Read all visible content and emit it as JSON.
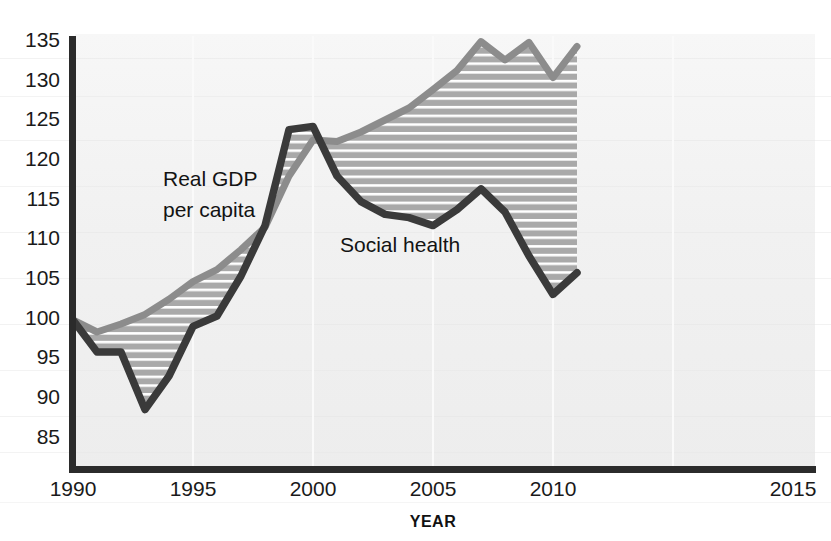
{
  "chart_data": {
    "type": "line",
    "title": "",
    "subtitle": "",
    "xlabel": "YEAR",
    "ylabel": "",
    "xlim": [
      1990,
      2015
    ],
    "ylim": [
      85,
      135
    ],
    "xticks": [
      1990,
      1995,
      2000,
      2005,
      2010,
      2015
    ],
    "yticks": [
      85,
      90,
      95,
      100,
      105,
      110,
      115,
      120,
      125,
      130,
      135
    ],
    "grid": "horizontal-hatch-between-series",
    "legend": "inline-annotations",
    "x": [
      1990,
      1991,
      1992,
      1993,
      1994,
      1995,
      1996,
      1997,
      1998,
      1999,
      2000,
      2001,
      2002,
      2003,
      2004,
      2005,
      2006,
      2007,
      2008,
      2009,
      2010,
      2011
    ],
    "series": [
      {
        "name": "Real GDP per capita",
        "color": "#8c8c8c",
        "values": [
          100.0,
          98.5,
          99.5,
          100.7,
          102.6,
          104.8,
          106.3,
          108.8,
          111.6,
          118.0,
          122.5,
          122.3,
          123.5,
          125.0,
          126.5,
          128.8,
          131.2,
          134.8,
          132.5,
          134.7,
          130.3,
          134.2
        ]
      },
      {
        "name": "Social health",
        "color": "#3a3a3a",
        "values": [
          100.0,
          96.0,
          96.0,
          88.8,
          93.0,
          99.2,
          100.5,
          105.5,
          111.8,
          123.8,
          124.2,
          118.0,
          114.8,
          113.2,
          112.8,
          111.8,
          113.8,
          116.4,
          113.5,
          108.0,
          103.2,
          105.9
        ]
      }
    ],
    "annotations": [
      {
        "text": "Real GDP\nper capita",
        "line1": "Real GDP",
        "line2": "per capita",
        "x": 1995.6,
        "y": 119.5
      },
      {
        "text": "Social health",
        "line1": "Social health",
        "x": 2003.6,
        "y": 110.5
      }
    ]
  },
  "axis": {
    "x_tick_labels": [
      "1990",
      "1995",
      "2000",
      "2005",
      "2010",
      "2015"
    ],
    "y_tick_labels": [
      "135",
      "130",
      "125",
      "120",
      "115",
      "110",
      "105",
      "100",
      "95",
      "90",
      "85"
    ],
    "x_axis_title": "YEAR"
  },
  "annotations": {
    "gdp_line1": "Real GDP",
    "gdp_line2": "per capita",
    "social": "Social health"
  },
  "colors": {
    "gdp": "#8c8c8c",
    "social": "#3a3a3a",
    "fill": "#a9a9a9",
    "fill_stripe": "#ffffff",
    "axis": "#2b2b2b",
    "plot_bg": "#f2f2f2",
    "page_bg": "#ffffff",
    "text": "#161616"
  }
}
